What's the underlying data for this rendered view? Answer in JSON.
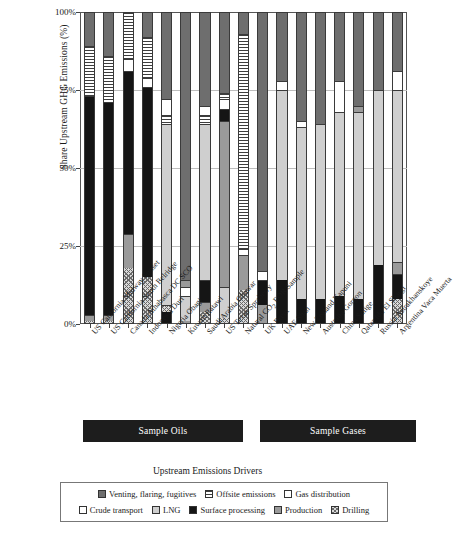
{
  "chart_data": {
    "type": "bar",
    "subtype": "stacked-percent",
    "title": "",
    "xlabel": "",
    "ylabel": "Share Upstream GHG Emissions (%)",
    "ylim": [
      0,
      100
    ],
    "yticks": [
      "0%",
      "25%",
      "50%",
      "75%",
      "100%"
    ],
    "ytick_values": [
      0,
      25,
      50,
      75,
      100
    ],
    "grid": true,
    "legend_position": "bottom",
    "legend_title": "Upstream Emissions Drivers",
    "categories": [
      "US California Midway Sunset",
      "US California South Belridge",
      "Canada Athabasca DC SCO",
      "Indonesia Duri",
      "Nigeria Obagi",
      "Kuwait Ratawi",
      "Saudi Arabia Ghawar",
      "US Texas Spraberry",
      "Natural CO2 EOR Sample",
      "UK Brent",
      "UAE Shah",
      "New Zealand Kapuni",
      "Australia Gorgon",
      "China Sulige",
      "Qatar Idd El Shargi",
      "Russia Astrakhanskoye",
      "Argentina Vaca Muerta"
    ],
    "series": [
      {
        "name": "Venting, flaring, fugitives",
        "key": "venting",
        "fill": "dark-gray-solid",
        "values": [
          11,
          14,
          0,
          8,
          28,
          100,
          34,
          33,
          7,
          100,
          24,
          36,
          100,
          19,
          100,
          25,
          18
        ]
      },
      {
        "name": "Offsite emissions",
        "key": "offsite",
        "fill": "horizontal-stripes",
        "values": [
          16,
          15,
          19,
          16,
          0,
          0,
          14,
          0,
          69,
          0,
          0,
          0,
          0,
          0,
          0,
          0,
          3
        ]
      },
      {
        "name": "Gas distribution",
        "key": "gas-distribution",
        "fill": "white",
        "values": [
          0,
          0,
          0,
          0,
          5,
          0,
          7,
          3,
          2,
          0,
          7,
          0,
          0,
          10,
          0,
          5,
          6
        ]
      },
      {
        "name": "Crude transport",
        "key": "crude-transport",
        "fill": "white",
        "values": [
          0,
          0,
          0,
          0,
          0,
          2,
          0,
          0,
          0,
          0,
          0,
          1,
          0,
          0,
          0,
          0,
          0
        ]
      },
      {
        "name": "LNG",
        "key": "lng",
        "fill": "light-gray",
        "values": [
          0,
          0,
          0,
          0,
          48,
          0,
          0,
          50,
          0,
          0,
          59,
          49,
          0,
          54,
          0,
          55,
          57
        ]
      },
      {
        "name": "Surface processing",
        "key": "surface-processing",
        "fill": "black",
        "values": [
          70,
          68,
          52,
          61,
          9,
          0,
          7,
          0,
          0,
          0,
          0,
          0,
          0,
          0,
          0,
          0,
          0
        ]
      },
      {
        "name": "Production",
        "key": "production",
        "fill": "mid-gray",
        "values": [
          2,
          2,
          11,
          0,
          0,
          11,
          0,
          0,
          11,
          0,
          10,
          14,
          0,
          17,
          0,
          15,
          8
        ]
      },
      {
        "name": "Drilling",
        "key": "drilling",
        "fill": "checkered",
        "values": [
          1,
          1,
          18,
          15,
          0,
          0,
          0,
          0,
          11,
          0,
          0,
          0,
          0,
          0,
          0,
          0,
          8
        ]
      }
    ],
    "stacks": [
      {
        "category": "US California Midway Sunset",
        "segments": [
          {
            "key": "drilling",
            "value": 1
          },
          {
            "key": "production",
            "value": 2
          },
          {
            "key": "surface-processing",
            "value": 70
          },
          {
            "key": "offsite",
            "value": 16
          },
          {
            "key": "venting",
            "value": 11
          }
        ]
      },
      {
        "category": "US California South Belridge",
        "segments": [
          {
            "key": "drilling",
            "value": 1
          },
          {
            "key": "production",
            "value": 2
          },
          {
            "key": "surface-processing",
            "value": 68
          },
          {
            "key": "offsite",
            "value": 15
          },
          {
            "key": "venting",
            "value": 14
          }
        ]
      },
      {
        "category": "Canada Athabasca DC SCO",
        "segments": [
          {
            "key": "drilling",
            "value": 18
          },
          {
            "key": "production",
            "value": 11
          },
          {
            "key": "surface-processing",
            "value": 52
          },
          {
            "key": "gas-distribution",
            "value": 4
          },
          {
            "key": "offsite",
            "value": 15
          }
        ]
      },
      {
        "category": "Indonesia Duri",
        "segments": [
          {
            "key": "drilling",
            "value": 15
          },
          {
            "key": "surface-processing",
            "value": 61
          },
          {
            "key": "gas-distribution",
            "value": 3
          },
          {
            "key": "offsite",
            "value": 13
          },
          {
            "key": "venting",
            "value": 8
          }
        ]
      },
      {
        "category": "Nigeria Obagi",
        "segments": [
          {
            "key": "surface-processing",
            "value": 4
          },
          {
            "key": "drilling",
            "value": 2
          },
          {
            "key": "lng",
            "value": 58
          },
          {
            "key": "offsite",
            "value": 3
          },
          {
            "key": "gas-distribution",
            "value": 5
          },
          {
            "key": "venting",
            "value": 28
          }
        ]
      },
      {
        "category": "Kuwait Ratawi",
        "segments": [
          {
            "key": "production",
            "value": 1
          },
          {
            "key": "lng",
            "value": 8
          },
          {
            "key": "crude-transport",
            "value": 3
          },
          {
            "key": "production",
            "value": 2
          },
          {
            "key": "venting",
            "value": 86
          }
        ]
      },
      {
        "category": "Saudi Arabia Ghawar",
        "segments": [
          {
            "key": "drilling",
            "value": 4
          },
          {
            "key": "production",
            "value": 3
          },
          {
            "key": "surface-processing",
            "value": 7
          },
          {
            "key": "lng",
            "value": 50
          },
          {
            "key": "offsite",
            "value": 3
          },
          {
            "key": "gas-distribution",
            "value": 3
          },
          {
            "key": "venting",
            "value": 30
          }
        ]
      },
      {
        "category": "US Texas Spraberry",
        "segments": [
          {
            "key": "drilling",
            "value": 2
          },
          {
            "key": "lng",
            "value": 10
          },
          {
            "key": "production",
            "value": 53
          },
          {
            "key": "surface-processing",
            "value": 4
          },
          {
            "key": "gas-distribution",
            "value": 3
          },
          {
            "key": "offsite",
            "value": 2
          },
          {
            "key": "venting",
            "value": 26
          }
        ]
      },
      {
        "category": "Natural CO2 EOR Sample",
        "segments": [
          {
            "key": "drilling",
            "value": 11
          },
          {
            "key": "production",
            "value": 11
          },
          {
            "key": "gas-distribution",
            "value": 2
          },
          {
            "key": "offsite",
            "value": 69
          },
          {
            "key": "venting",
            "value": 7
          }
        ]
      },
      {
        "category": "UK Brent",
        "segments": [
          {
            "key": "production",
            "value": 6
          },
          {
            "key": "surface-processing",
            "value": 8
          },
          {
            "key": "gas-distribution",
            "value": 3
          },
          {
            "key": "venting",
            "value": 83
          }
        ]
      },
      {
        "category": "UAE Shah",
        "segments": [
          {
            "key": "surface-processing",
            "value": 14
          },
          {
            "key": "lng",
            "value": 61
          },
          {
            "key": "gas-distribution",
            "value": 3
          },
          {
            "key": "venting",
            "value": 22
          }
        ]
      },
      {
        "category": "New Zealand Kapuni",
        "segments": [
          {
            "key": "surface-processing",
            "value": 8
          },
          {
            "key": "lng",
            "value": 55
          },
          {
            "key": "crude-transport",
            "value": 2
          },
          {
            "key": "venting",
            "value": 35
          }
        ]
      },
      {
        "category": "Australia Gorgon",
        "segments": [
          {
            "key": "surface-processing",
            "value": 8
          },
          {
            "key": "lng",
            "value": 56
          },
          {
            "key": "venting",
            "value": 36
          }
        ]
      },
      {
        "category": "China Sulige",
        "segments": [
          {
            "key": "surface-processing",
            "value": 9
          },
          {
            "key": "lng",
            "value": 59
          },
          {
            "key": "gas-distribution",
            "value": 10
          },
          {
            "key": "venting",
            "value": 22
          }
        ]
      },
      {
        "category": "Qatar Idd El Shargi",
        "segments": [
          {
            "key": "surface-processing",
            "value": 8
          },
          {
            "key": "lng",
            "value": 60
          },
          {
            "key": "production",
            "value": 2
          },
          {
            "key": "venting",
            "value": 30
          }
        ]
      },
      {
        "category": "Russia Astrakhanskoye",
        "segments": [
          {
            "key": "surface-processing",
            "value": 19
          },
          {
            "key": "lng",
            "value": 56
          },
          {
            "key": "venting",
            "value": 25
          }
        ]
      },
      {
        "category": "Argentina Vaca Muerta",
        "segments": [
          {
            "key": "drilling",
            "value": 8
          },
          {
            "key": "surface-processing",
            "value": 8
          },
          {
            "key": "production",
            "value": 4
          },
          {
            "key": "lng",
            "value": 55
          },
          {
            "key": "gas-distribution",
            "value": 6
          },
          {
            "key": "venting",
            "value": 19
          }
        ]
      }
    ],
    "groups": [
      {
        "label": "Sample Oils",
        "start": 0,
        "end": 8
      },
      {
        "label": "Sample Gases",
        "start": 9,
        "end": 16
      }
    ],
    "legend_entries": [
      {
        "label": "Venting, flaring, fugitives",
        "key": "venting",
        "swatch": "dark-gray-solid"
      },
      {
        "label": "Offsite emissions",
        "key": "offsite",
        "swatch": "horizontal-stripes"
      },
      {
        "label": "Gas distribution",
        "key": "gas-distribution",
        "swatch": "white"
      },
      {
        "label": "Crude transport",
        "key": "crude-transport",
        "swatch": "white"
      },
      {
        "label": "LNG",
        "key": "lng",
        "swatch": "light-gray"
      },
      {
        "label": "Surface processing",
        "key": "surface-processing",
        "swatch": "black"
      },
      {
        "label": "Production",
        "key": "production",
        "swatch": "mid-gray"
      },
      {
        "label": "Drilling",
        "key": "drilling",
        "swatch": "checkered"
      }
    ],
    "colors": {
      "venting": "#6e6e6e",
      "offsite": "#ffffff",
      "gas-distribution": "#ffffff",
      "crude-transport": "#ffffff",
      "lng": "#cfcfcf",
      "surface-processing": "#151515",
      "production": "#9a9a9a",
      "drilling": "#d9d9d9",
      "band": "#1d1d1d",
      "grid": "#bdbdbd",
      "axis": "#555555"
    }
  }
}
